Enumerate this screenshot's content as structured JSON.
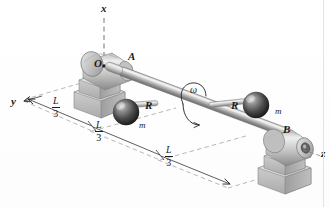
{
  "figure": {
    "type": "engineering-mechanics-diagram",
    "width": 330,
    "height": 207,
    "background_color": "#ffffff"
  },
  "axes": {
    "x": {
      "label": "x",
      "style": "dash-dot",
      "direction": "vertical-up",
      "x": 103,
      "y": 9
    },
    "y": {
      "label": "y",
      "style": "dashed",
      "direction": "left-down",
      "x": 15,
      "y": 103
    },
    "z": {
      "label": "z",
      "style": "dashed-leader",
      "direction": "right-down",
      "x": 314,
      "y": 152
    },
    "origin": {
      "label": "O",
      "x": 96,
      "y": 63,
      "has_dot": true
    }
  },
  "bearings": [
    {
      "name": "A",
      "label": "A",
      "label_x": 130,
      "label_y": 59,
      "position": "upper-left"
    },
    {
      "name": "B",
      "label": "B",
      "label_x": 284,
      "label_y": 132,
      "position": "lower-right"
    }
  ],
  "masses": [
    {
      "radius_label": "R",
      "radius_label_x": 147,
      "radius_label_y": 107,
      "mass_label": "m",
      "mass_label_x": 141,
      "mass_label_y": 127,
      "sphere_cx": 126,
      "sphere_cy": 112,
      "sphere_r": 13
    },
    {
      "radius_label": "R",
      "radius_label_x": 233,
      "radius_label_y": 107,
      "mass_label": "m",
      "mass_label_x": 277,
      "mass_label_y": 113,
      "sphere_cx": 256,
      "sphere_cy": 105,
      "sphere_r": 13
    }
  ],
  "rotation": {
    "symbol": "ω",
    "label_x": 193,
    "label_y": 91,
    "description": "angular velocity arrow curling around the shaft"
  },
  "dimensions": [
    {
      "numerator": "L",
      "denominator": "3",
      "x": 57,
      "y": 103,
      "segment": "A-to-first-sphere"
    },
    {
      "numerator": "L",
      "denominator": "3",
      "x": 100,
      "y": 127,
      "segment": "first-sphere-to-second-sphere"
    },
    {
      "numerator": "L",
      "denominator": "3",
      "x": 170,
      "y": 152,
      "segment": "second-sphere-to-B"
    }
  ],
  "colors": {
    "line": "#2a2a2a",
    "shaft_light": "#dcdcdc",
    "shaft_mid": "#9a9a9a",
    "shaft_dark": "#6b6b6b",
    "block_light": "#e4e4e4",
    "block_mid": "#bcbcbc",
    "block_dark": "#8e8e8e",
    "sphere_light": "#cfcfcf",
    "sphere_dark": "#2b2b2b",
    "dashed": "#8a8a8a",
    "text": "#1b1b1b",
    "edge_rule": "#e3e3e3"
  }
}
